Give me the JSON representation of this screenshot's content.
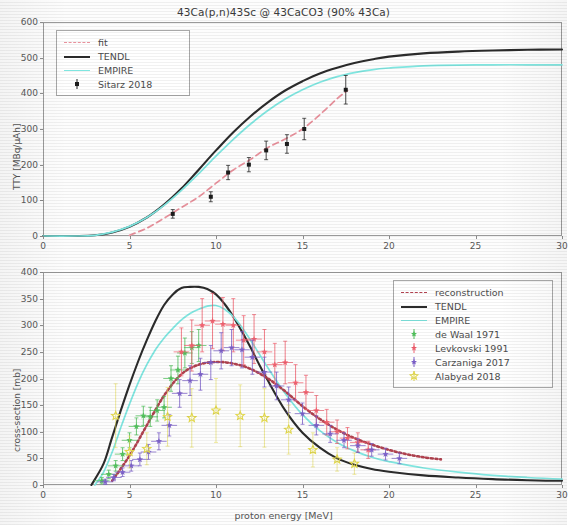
{
  "figure": {
    "title": "43Ca(p,n)43Sc @ 43CaCO3 (90% 43Ca)",
    "xlabel": "proton energy [MeV]"
  },
  "colors": {
    "tendl": "#2b2b2b",
    "empire": "#7fe6e0",
    "fit": "#e8919c",
    "reconstruction": "#b0424f",
    "de_waal": "#4fbf5a",
    "levkovski": "#f0606e",
    "carzaniga": "#7b5fc9",
    "alabyad": "#e2d84a",
    "sitarz": "#1c1c1c",
    "axis": "#9a9a9a"
  },
  "top_panel": {
    "ylabel": "TTY [MBq/µAh]",
    "yticks": [
      "0",
      "100",
      "200",
      "300",
      "400",
      "500",
      "600"
    ],
    "xticks": [
      "0",
      "5",
      "10",
      "15",
      "20",
      "25",
      "30"
    ],
    "legend": [
      {
        "label": "fit",
        "style": "dashed",
        "color": "#e8919c"
      },
      {
        "label": "TENDL",
        "style": "solid",
        "color": "#2b2b2b"
      },
      {
        "label": "EMPIRE",
        "style": "solid",
        "color": "#7fe6e0"
      },
      {
        "label": "Sitarz 2018",
        "style": "errorbar",
        "color": "#1c1c1c"
      }
    ]
  },
  "bottom_panel": {
    "ylabel": "cross-section [mb]",
    "yticks": [
      "0",
      "50",
      "100",
      "150",
      "200",
      "250",
      "300",
      "350",
      "400"
    ],
    "xticks": [
      "0",
      "5",
      "10",
      "15",
      "20",
      "25",
      "30"
    ],
    "legend": [
      {
        "label": "reconstruction",
        "style": "dashed",
        "color": "#b0424f"
      },
      {
        "label": "TENDL",
        "style": "solid",
        "color": "#2b2b2b"
      },
      {
        "label": "EMPIRE",
        "style": "solid",
        "color": "#7fe6e0"
      },
      {
        "label": "de Waal 1971",
        "style": "errorbar",
        "color": "#4fbf5a"
      },
      {
        "label": "Levkovski 1991",
        "style": "errorbar",
        "color": "#f0606e"
      },
      {
        "label": "Carzaniga 2017",
        "style": "errorbar",
        "color": "#7b5fc9"
      },
      {
        "label": "Alabyad 2018",
        "style": "star",
        "color": "#e2d84a"
      }
    ]
  },
  "chart_data": [
    {
      "type": "line",
      "panel": "top",
      "title": "43Ca(p,n)43Sc @ 43CaCO3 (90% 43Ca)",
      "xlabel": "proton energy [MeV]",
      "ylabel": "TTY [MBq/µAh]",
      "xlim": [
        0,
        30
      ],
      "ylim": [
        0,
        600
      ],
      "grid": false,
      "legend_position": "upper-left",
      "series": [
        {
          "name": "TENDL",
          "style": "solid",
          "color": "#2b2b2b",
          "x": [
            0,
            2,
            3,
            4,
            5,
            6,
            7,
            8,
            9,
            10,
            11,
            12,
            13,
            14,
            15,
            16,
            17,
            18,
            19,
            20,
            22,
            24,
            26,
            28,
            30
          ],
          "y": [
            0,
            0,
            2,
            10,
            26,
            52,
            88,
            133,
            186,
            240,
            291,
            336,
            375,
            408,
            434,
            456,
            472,
            485,
            495,
            503,
            512,
            517,
            520,
            522,
            523
          ]
        },
        {
          "name": "EMPIRE",
          "style": "solid",
          "color": "#7fe6e0",
          "x": [
            0,
            2,
            3,
            4,
            5,
            6,
            7,
            8,
            9,
            10,
            11,
            12,
            13,
            14,
            15,
            16,
            17,
            18,
            19,
            20,
            22,
            24,
            26,
            28,
            30
          ],
          "y": [
            0,
            0,
            2,
            11,
            27,
            52,
            86,
            128,
            175,
            224,
            271,
            314,
            352,
            384,
            410,
            431,
            447,
            458,
            466,
            471,
            477,
            479,
            480,
            480,
            480
          ]
        },
        {
          "name": "fit",
          "style": "dashed",
          "color": "#e8919c",
          "x": [
            5,
            6,
            7,
            8,
            9,
            10,
            11,
            12,
            13,
            14,
            15,
            16,
            17,
            17.6
          ],
          "y": [
            2,
            22,
            50,
            80,
            110,
            148,
            185,
            215,
            248,
            272,
            300,
            340,
            385,
            408
          ]
        },
        {
          "name": "Sitarz 2018",
          "style": "errorbar",
          "color": "#1c1c1c",
          "x": [
            7.5,
            9.7,
            10.7,
            11.9,
            12.9,
            14.1,
            15.1,
            17.5
          ],
          "y": [
            62,
            110,
            178,
            200,
            240,
            258,
            300,
            410
          ],
          "yerr": [
            12,
            14,
            20,
            20,
            26,
            26,
            30,
            40
          ]
        }
      ]
    },
    {
      "type": "line",
      "panel": "bottom",
      "xlabel": "proton energy [MeV]",
      "ylabel": "cross-section [mb]",
      "xlim": [
        0,
        30
      ],
      "ylim": [
        0,
        400
      ],
      "grid": false,
      "legend_position": "upper-right",
      "series": [
        {
          "name": "TENDL",
          "style": "solid",
          "color": "#2b2b2b",
          "x": [
            2.8,
            3.5,
            4,
            4.5,
            5,
            5.5,
            6,
            6.5,
            7,
            7.5,
            8,
            8.5,
            9,
            9.5,
            10,
            10.5,
            11,
            11.5,
            12,
            12.5,
            13,
            14,
            15,
            16,
            17,
            18,
            19,
            20,
            22,
            24,
            26,
            28,
            30
          ],
          "y": [
            0,
            40,
            90,
            140,
            188,
            232,
            272,
            308,
            338,
            358,
            370,
            372,
            372,
            368,
            358,
            340,
            316,
            288,
            258,
            226,
            196,
            140,
            98,
            70,
            50,
            38,
            30,
            25,
            18,
            14,
            11,
            9,
            8
          ]
        },
        {
          "name": "EMPIRE",
          "style": "solid",
          "color": "#7fe6e0",
          "x": [
            3,
            3.5,
            4,
            4.5,
            5,
            5.5,
            6,
            6.5,
            7,
            7.5,
            8,
            8.5,
            9,
            9.5,
            10,
            10.5,
            11,
            11.5,
            12,
            12.5,
            13,
            14,
            15,
            16,
            17,
            18,
            19,
            20,
            22,
            24,
            26,
            28,
            30
          ],
          "y": [
            0,
            24,
            62,
            108,
            152,
            192,
            226,
            254,
            276,
            294,
            310,
            322,
            330,
            336,
            337,
            330,
            316,
            296,
            272,
            246,
            220,
            172,
            132,
            102,
            80,
            64,
            52,
            44,
            32,
            24,
            18,
            14,
            11
          ]
        },
        {
          "name": "reconstruction",
          "style": "dashed-dotted",
          "color": "#b0424f",
          "x": [
            4,
            5,
            6,
            7,
            8,
            9,
            10,
            11,
            12,
            13,
            14,
            15,
            16,
            17,
            18,
            19,
            20,
            21,
            22,
            23
          ],
          "y": [
            8,
            55,
            112,
            168,
            208,
            226,
            231,
            228,
            218,
            200,
            176,
            148,
            124,
            104,
            88,
            76,
            66,
            58,
            52,
            48
          ]
        },
        {
          "name": "de Waal 1971",
          "style": "errorbar",
          "color": "#4fbf5a",
          "x": [
            3.4,
            3.8,
            4.2,
            4.6,
            5.0,
            5.4,
            5.8,
            6.2,
            6.6,
            7.0,
            7.4,
            7.8,
            8.2,
            8.6,
            9.0
          ],
          "y": [
            8,
            20,
            36,
            58,
            84,
            110,
            130,
            128,
            140,
            146,
            200,
            216,
            248,
            258,
            262
          ],
          "yerr": [
            6,
            8,
            10,
            12,
            14,
            16,
            18,
            18,
            20,
            20,
            24,
            26,
            28,
            30,
            30
          ]
        },
        {
          "name": "Levkovski 1991",
          "style": "errorbar",
          "color": "#f0606e",
          "x": [
            8.0,
            8.6,
            9.2,
            9.8,
            10.4,
            11.0,
            11.6,
            12.2,
            12.8,
            13.4,
            14.0,
            14.6,
            15.2,
            15.8,
            16.4,
            17.0,
            17.6,
            18.2,
            18.8
          ],
          "y": [
            250,
            262,
            300,
            308,
            302,
            300,
            272,
            274,
            250,
            226,
            230,
            192,
            174,
            140,
            118,
            100,
            88,
            80,
            66
          ],
          "yerr": [
            45,
            48,
            50,
            52,
            50,
            50,
            46,
            46,
            42,
            40,
            40,
            34,
            32,
            28,
            24,
            22,
            20,
            18,
            16
          ]
        },
        {
          "name": "Carzaniga 2017",
          "style": "errorbar",
          "color": "#7b5fc9",
          "x": [
            3.6,
            4.1,
            4.6,
            5.1,
            5.6,
            6.1,
            6.7,
            7.3,
            7.9,
            8.5,
            9.1,
            9.7,
            10.3,
            10.9,
            11.5,
            12.1,
            12.8,
            13.5,
            14.2,
            15.0,
            15.8,
            16.6,
            17.4,
            18.2,
            19.0,
            19.8,
            20.6
          ],
          "y": [
            6,
            14,
            24,
            36,
            48,
            62,
            82,
            112,
            172,
            196,
            208,
            230,
            252,
            258,
            254,
            240,
            212,
            186,
            160,
            134,
            112,
            96,
            84,
            74,
            66,
            58,
            50
          ],
          "yerr": [
            5,
            6,
            8,
            10,
            12,
            14,
            16,
            20,
            26,
            28,
            30,
            32,
            34,
            34,
            34,
            32,
            28,
            26,
            24,
            20,
            18,
            16,
            14,
            13,
            12,
            11,
            10
          ]
        },
        {
          "name": "Alabyad 2018",
          "style": "star",
          "color": "#e2d84a",
          "x": [
            4.2,
            5.0,
            6.0,
            7.2,
            8.6,
            10.0,
            11.4,
            12.8,
            14.2,
            15.6,
            17.0,
            18.0
          ],
          "y": [
            130,
            62,
            68,
            128,
            126,
            140,
            130,
            126,
            104,
            66,
            48,
            40
          ],
          "yerr": [
            60,
            30,
            30,
            55,
            55,
            60,
            58,
            55,
            46,
            32,
            22,
            20
          ]
        }
      ]
    }
  ]
}
